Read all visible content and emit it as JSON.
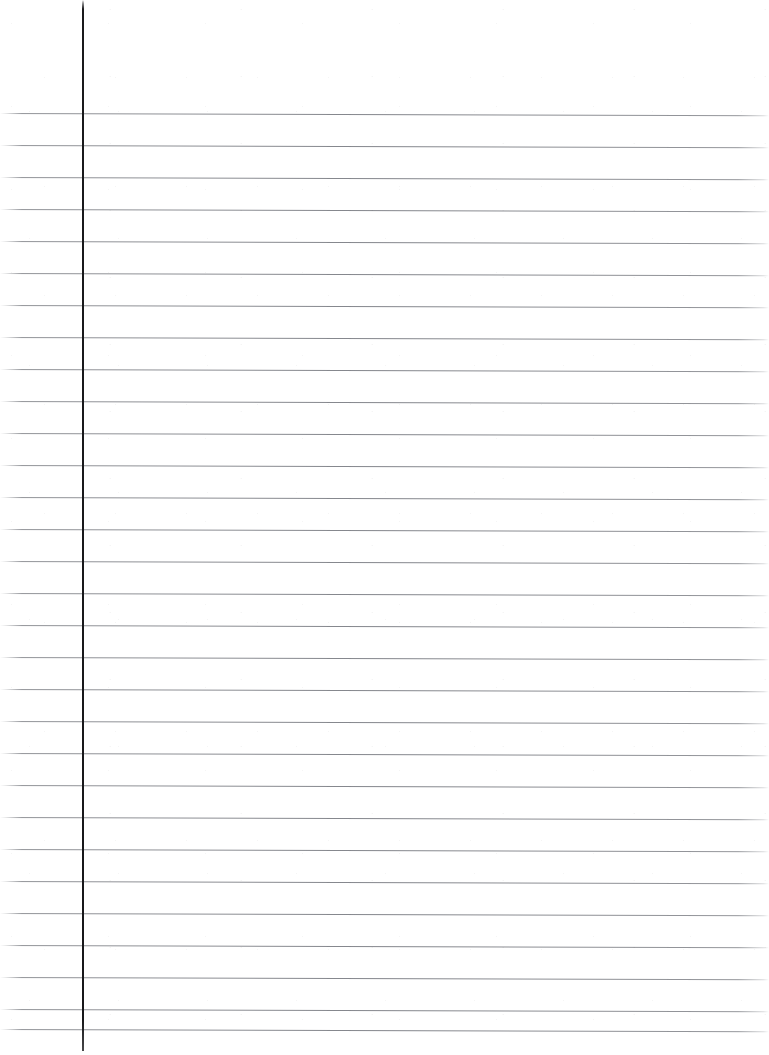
{
  "document": {
    "type": "scanned-lined-paper",
    "title": "Blank Lined Notebook Page",
    "description": "Scanned blank ruled notebook sheet with a single vertical margin rule and horizontal ruled lines. No handwriting or printed text is present.",
    "page_width": 769,
    "page_height": 1055,
    "background_color": "#ffffff",
    "content_text": ""
  },
  "margin_rule": {
    "name": "vertical-margin-line",
    "color": "#1a1a1c",
    "x": 82,
    "width": 2,
    "top": 0,
    "height": 1051,
    "orientation": "vertical"
  },
  "ruling": {
    "name": "horizontal-ruled-lines",
    "color": "#84868c",
    "line_thickness": 1,
    "first_line_y": 113,
    "last_line_y": 1029,
    "spacing": 32.0,
    "count": 30,
    "left_x": 0,
    "right_x": 769,
    "skew_degrees": 0.16,
    "line_y_positions": [
      113,
      145,
      177,
      209,
      241,
      273,
      305,
      337,
      369,
      401,
      433,
      465,
      497,
      529,
      561,
      593,
      625,
      657,
      689,
      721,
      753,
      785,
      817,
      849,
      881,
      913,
      945,
      977,
      1009,
      1029
    ]
  },
  "regions": {
    "header_margin": {
      "name": "top-blank-margin",
      "label": "",
      "top": 0,
      "height": 113
    },
    "left_margin": {
      "name": "left-margin-column",
      "label": "",
      "left": 0,
      "width": 82
    },
    "writing_area": {
      "name": "writing-area",
      "label": "",
      "left": 84,
      "width": 685
    }
  }
}
